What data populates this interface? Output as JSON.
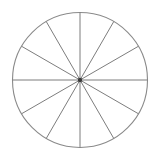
{
  "figure": {
    "name": "fraction-circle-twelfths",
    "background_color": "#ffffff",
    "canvas": {
      "width": 159,
      "height": 157
    },
    "circle": {
      "center_x": 80,
      "center_y": 80,
      "radius": 67.5,
      "stroke_color": "#8a8a8a",
      "stroke_width": 1.1,
      "fill_color": "#ffffff"
    },
    "center_dot": {
      "radius": 2.2,
      "color": "#3a3a3a"
    },
    "sectors": {
      "count": 12,
      "angle_step_degrees": 30,
      "fraction_label": "1/12"
    },
    "dividers": {
      "count": 6,
      "stroke_color": "#7d7d7d",
      "stroke_width": 1.0,
      "angles_degrees": [
        0,
        30,
        60,
        90,
        120,
        150
      ]
    },
    "divider_lines": [
      {
        "name": "divider-vertical",
        "angle_degrees": 90,
        "x1": 80,
        "y1": 12.5,
        "x2": 80,
        "y2": 147.5
      },
      {
        "name": "divider-horizontal",
        "angle_degrees": 0,
        "x1": 12.5,
        "y1": 80,
        "x2": 147.5,
        "y2": 80
      },
      {
        "name": "divider-30deg",
        "angle_degrees": 30,
        "x1": 138.45,
        "y1": 46.25,
        "x2": 21.55,
        "y2": 113.75
      },
      {
        "name": "divider-60deg",
        "angle_degrees": 60,
        "x1": 113.75,
        "y1": 21.55,
        "x2": 46.25,
        "y2": 138.45
      },
      {
        "name": "divider-120deg",
        "angle_degrees": 120,
        "x1": 46.25,
        "y1": 21.55,
        "x2": 113.75,
        "y2": 138.45
      },
      {
        "name": "divider-150deg",
        "angle_degrees": 150,
        "x1": 21.55,
        "y1": 46.25,
        "x2": 138.45,
        "y2": 113.75
      }
    ]
  },
  "chart_data": {
    "type": "pie",
    "categories": [
      "1",
      "2",
      "3",
      "4",
      "5",
      "6",
      "7",
      "8",
      "9",
      "10",
      "11",
      "12"
    ],
    "values": [
      1,
      1,
      1,
      1,
      1,
      1,
      1,
      1,
      1,
      1,
      1,
      1
    ],
    "slice_angle_degrees": 30,
    "slice_fraction": "1/12",
    "labels_shown": false,
    "legend": "none",
    "grid": false,
    "xlabel": "",
    "ylabel": ""
  }
}
